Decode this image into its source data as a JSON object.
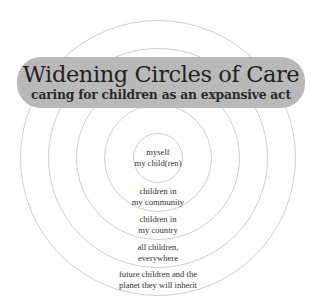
{
  "title": "Widening Circles of Care",
  "subtitle": "caring for children as an expansive act",
  "colors": {
    "banner": "#b9b9b9",
    "circle_stroke": "#cfcfcf",
    "text": "#333333"
  },
  "rings": [
    {
      "level": 1,
      "lines": [
        "myself",
        "my child(ren)"
      ]
    },
    {
      "level": 2,
      "lines": [
        "children in",
        "my community"
      ]
    },
    {
      "level": 3,
      "lines": [
        "children in",
        "my country"
      ]
    },
    {
      "level": 4,
      "lines": [
        "all children,",
        "everywhere"
      ]
    },
    {
      "level": 5,
      "lines": [
        "future children and the",
        "planet they will inherit"
      ]
    }
  ]
}
